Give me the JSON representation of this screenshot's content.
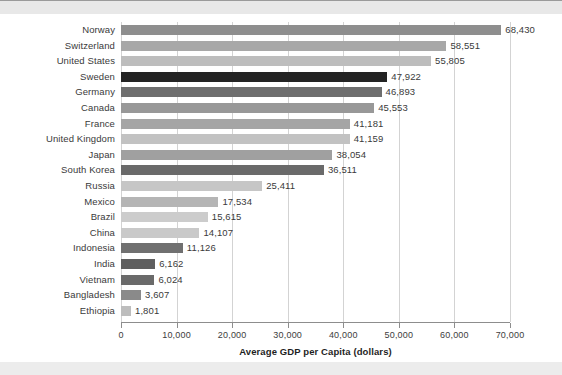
{
  "chart_data": {
    "type": "bar",
    "orientation": "horizontal",
    "title": "",
    "xlabel": "Average GDP per Capita (dollars)",
    "ylabel": "",
    "xlim": [
      0,
      70000
    ],
    "xticks": [
      0,
      10000,
      20000,
      30000,
      40000,
      50000,
      60000,
      70000
    ],
    "xtick_labels": [
      "0",
      "10,000",
      "20,000",
      "30,000",
      "40,000",
      "50,000",
      "60,000",
      "70,000"
    ],
    "grid": "vertical",
    "legend": "none",
    "categories": [
      "Norway",
      "Switzerland",
      "United States",
      "Sweden",
      "Germany",
      "Canada",
      "France",
      "United Kingdom",
      "Japan",
      "South Korea",
      "Russia",
      "Mexico",
      "Brazil",
      "China",
      "Indonesia",
      "India",
      "Vietnam",
      "Bangladesh",
      "Ethiopia"
    ],
    "values": [
      68430,
      58551,
      55805,
      47922,
      46893,
      45553,
      41181,
      41159,
      38054,
      36511,
      25411,
      17534,
      15615,
      14107,
      11126,
      6162,
      6024,
      3607,
      1801
    ],
    "value_labels": [
      "68,430",
      "58,551",
      "55,805",
      "47,922",
      "46,893",
      "45,553",
      "41,181",
      "41,159",
      "38,054",
      "36,511",
      "25,411",
      "17,534",
      "15,615",
      "14,107",
      "11,126",
      "6,162",
      "6,024",
      "3,607",
      "1,801"
    ],
    "bar_colors": [
      "#8e8e8e",
      "#a8a8a8",
      "#bdbdbd",
      "#232323",
      "#6e6e6e",
      "#989898",
      "#a5a5a5",
      "#c2c2c2",
      "#a0a0a0",
      "#6a6a6a",
      "#c6c6c6",
      "#b5b5b5",
      "#cccccc",
      "#c9c9c9",
      "#707070",
      "#5f5f5f",
      "#6a6a6a",
      "#8a8a8a",
      "#bdbdbd"
    ],
    "colors": {
      "grid": "#d3d3d3",
      "axis": "#8d8d8d",
      "text": "#3a3a3a",
      "axis_title": "#1f1f1f",
      "background": "#ffffff",
      "page_band": "#e8e8e8"
    }
  }
}
